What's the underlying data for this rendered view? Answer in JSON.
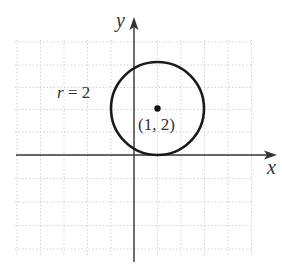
{
  "diagram": {
    "type": "circle-on-coordinate-plane",
    "axes": {
      "x_label": "x",
      "y_label": "y"
    },
    "grid": {
      "visible": true,
      "style": "dotted",
      "x_range": [
        -5,
        5
      ],
      "y_range": [
        -4,
        5
      ]
    },
    "circle": {
      "center": [
        1,
        2
      ],
      "radius": 2,
      "center_label": "(1, 2)",
      "radius_label": "r = 2",
      "radius_label_var": "r",
      "radius_label_rest": " = 2"
    },
    "colors": {
      "grid": "#c8c8c8",
      "axis": "#333333",
      "circle": "#1a1a1a",
      "text": "#333333"
    }
  }
}
